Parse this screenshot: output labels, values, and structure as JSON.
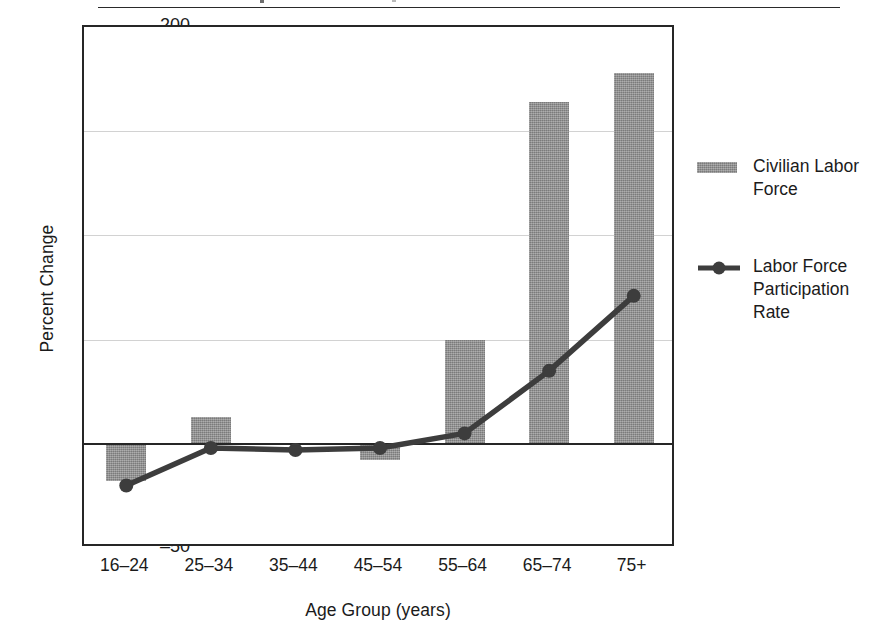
{
  "chart_data": {
    "type": "bar",
    "title": "",
    "xlabel": "Age Group (years)",
    "ylabel": "Percent Change",
    "categories": [
      "16–24",
      "25–34",
      "35–44",
      "45–54",
      "55–64",
      "65–74",
      "75+"
    ],
    "ylim": [
      -50,
      200
    ],
    "yticks": [
      200,
      150,
      100,
      50,
      0,
      -50
    ],
    "ytick_labels": [
      "200",
      "150",
      "100",
      "50",
      "0",
      "–50"
    ],
    "grid": "horizontal",
    "legend_position": "right",
    "series": [
      {
        "name": "Civilian Labor Force",
        "type": "bar",
        "color": "#8c8c8c",
        "values": [
          -18,
          13,
          0,
          -8,
          50,
          164,
          178
        ]
      },
      {
        "name": "Labor Force Participation Rate",
        "type": "line",
        "color": "#3d3d3d",
        "marker": "circle",
        "values": [
          -20,
          -2,
          -3,
          -2,
          5,
          35,
          71
        ]
      }
    ]
  },
  "axes": {
    "y_title": "Percent Change",
    "x_title": "Age Group (years)"
  },
  "legend": {
    "entries": [
      {
        "label": "Civilian Labor\nForce",
        "swatch": "bar-swatch"
      },
      {
        "label": "Labor Force\nParticipation\nRate",
        "swatch": "line-marker-swatch"
      }
    ]
  }
}
